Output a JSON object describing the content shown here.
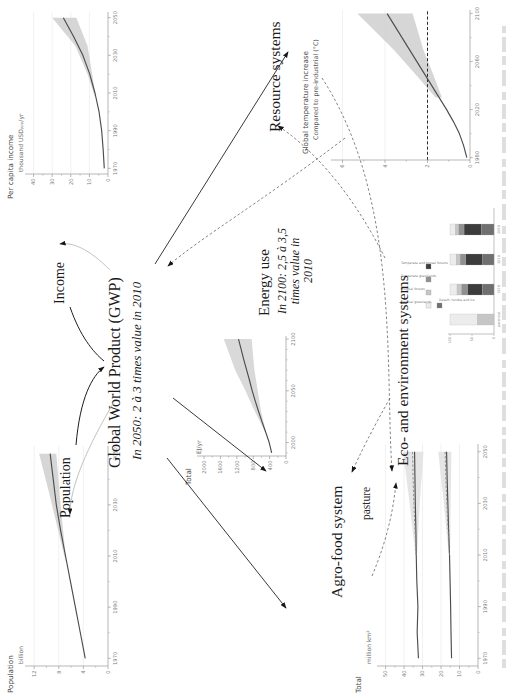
{
  "labels": {
    "population": "Population",
    "income": "Income",
    "gwp_title": "Global World Product (GWP)",
    "gwp_note": "In 2050: 2 à 3 times value in 2010",
    "energy_use": "Energy use",
    "energy_note1": "In 2100: 2,5 à 3,5",
    "energy_note2": "times value in",
    "energy_note3": "2010",
    "agro_heading": "Agro-food system",
    "resource_heading": "Resource systems",
    "eco_heading": "Eco- and environment systems"
  },
  "colors": {
    "curve": "#4d4d4d",
    "band": "#d2d2d2",
    "band_light": "#e0e0e0",
    "axis": "#9a9a9a",
    "arrow": "#161616",
    "feedback": "#bbbbbb",
    "dashed": "#6e6e6e"
  },
  "chart_data": [
    {
      "id": "population",
      "type": "line",
      "title": "Population",
      "ylabel": "billion",
      "xlim": [
        1967,
        2053
      ],
      "ylim": [
        0,
        13
      ],
      "xticks": [
        1970,
        1990,
        2010,
        2030,
        2050
      ],
      "xminor": [
        1980,
        2000,
        2020,
        2040
      ],
      "yticks": [
        0,
        4,
        8,
        12
      ],
      "yminor": [
        2,
        6,
        10
      ],
      "grid": true,
      "band_color": "#cfcfcf",
      "series": [
        {
          "name": "world population",
          "style": "solid",
          "x": [
            1970,
            1980,
            1990,
            2000,
            2010,
            2020,
            2030,
            2040,
            2050
          ],
          "y": [
            3.7,
            4.5,
            5.3,
            6.1,
            6.9,
            7.7,
            8.4,
            8.9,
            9.4
          ]
        }
      ],
      "bands": [
        {
          "x": [
            2008,
            2020,
            2035,
            2050
          ],
          "lo": [
            6.8,
            7.3,
            7.9,
            8.4
          ],
          "hi": [
            6.9,
            8.1,
            9.6,
            11.2
          ]
        }
      ]
    },
    {
      "id": "income",
      "type": "line",
      "title": "Per capita income",
      "ylabel": "thousand USD",
      "ylabel_sub": "PPP",
      "ylabel_tail": "/yr",
      "xlim": [
        1967,
        2053
      ],
      "ylim": [
        0,
        43
      ],
      "xticks": [
        1970,
        1990,
        2010,
        2030,
        2050
      ],
      "xminor": [
        1980,
        2000,
        2020,
        2040
      ],
      "yticks": [
        0,
        10,
        20,
        30,
        40
      ],
      "yminor": [
        5,
        15,
        25,
        35
      ],
      "grid": true,
      "band_color": "#cfcfcf",
      "series": [
        {
          "name": "per capita income",
          "style": "solid",
          "x": [
            1970,
            1980,
            1990,
            2000,
            2010,
            2020,
            2030,
            2040,
            2050
          ],
          "y": [
            2,
            2.6,
            3.4,
            4.8,
            7,
            9.8,
            13.5,
            18.5,
            24
          ]
        }
      ],
      "bands": [
        {
          "x": [
            2008,
            2020,
            2035,
            2050
          ],
          "lo": [
            6.6,
            8.5,
            11,
            17
          ],
          "hi": [
            7.1,
            11,
            17.5,
            30
          ]
        }
      ]
    },
    {
      "id": "energy",
      "type": "line",
      "title": "Total",
      "ylabel": "EJ/yr",
      "xlim": [
        1987,
        2103
      ],
      "ylim": [
        0,
        2100
      ],
      "xticks": [
        2000,
        2050,
        2100
      ],
      "xminor": [
        1990,
        2010,
        2020,
        2030,
        2040,
        2060,
        2070,
        2080,
        2090
      ],
      "yticks": [
        0,
        400,
        800,
        1200,
        1600,
        2000
      ],
      "yminor": [
        200,
        600,
        1000,
        1400,
        1800
      ],
      "grid": false,
      "band_color": "#d2d2d2",
      "series": [
        {
          "name": "total energy use",
          "style": "solid",
          "x": [
            1990,
            2000,
            2010,
            2020,
            2030,
            2040,
            2050,
            2060,
            2070,
            2080,
            2090,
            2100
          ],
          "y": [
            350,
            410,
            495,
            585,
            670,
            750,
            825,
            890,
            960,
            1030,
            1095,
            1160
          ]
        }
      ],
      "bands": [
        {
          "x": [
            2010,
            2030,
            2050,
            2070,
            2100
          ],
          "lo": [
            485,
            610,
            690,
            770,
            840
          ],
          "hi": [
            510,
            760,
            990,
            1240,
            1520
          ]
        }
      ]
    },
    {
      "id": "temperature",
      "type": "line",
      "title": "Global temperature increase",
      "subtitle": "Compared to pre-industrial (°C)",
      "xlim": [
        1978,
        2103
      ],
      "ylim": [
        0,
        6.4
      ],
      "xticks": [
        1980,
        2020,
        2060,
        2100
      ],
      "xminor": [
        2000,
        2040,
        2080
      ],
      "yticks": [
        0,
        2,
        4,
        6
      ],
      "yminor": [
        1,
        3,
        5
      ],
      "grid": true,
      "refline": 2,
      "band_color": "#cfcfcf",
      "series": [
        {
          "name": "temperature increase",
          "style": "solid",
          "x": [
            1980,
            1990,
            2000,
            2010,
            2020,
            2030,
            2040,
            2050,
            2060,
            2070,
            2080,
            2090,
            2100
          ],
          "y": [
            0.15,
            0.3,
            0.5,
            0.78,
            1.1,
            1.45,
            1.8,
            2.15,
            2.5,
            2.85,
            3.2,
            3.55,
            3.9
          ]
        }
      ],
      "bands": [
        {
          "x": [
            2030,
            2050,
            2070,
            2100
          ],
          "lo": [
            1.32,
            1.75,
            2.2,
            2.7
          ],
          "hi": [
            1.62,
            2.6,
            3.6,
            5.3
          ]
        }
      ]
    },
    {
      "id": "agrofood",
      "type": "line",
      "title": "Total",
      "ylabel": "million km²",
      "annotation": "pasture",
      "xlim": [
        1967,
        2053
      ],
      "ylim": [
        0,
        53
      ],
      "xticks": [
        1970,
        1990,
        2010,
        2030,
        2050
      ],
      "xminor": [
        1980,
        2000,
        2020,
        2040
      ],
      "yticks": [
        0,
        10,
        20,
        30,
        40,
        50
      ],
      "yminor": [
        5,
        15,
        25,
        35,
        45
      ],
      "grid": true,
      "band_color": "#e0e0e0",
      "series": [
        {
          "name": "pasture",
          "style": "solid",
          "x": [
            1970,
            1980,
            1990,
            2000,
            2010,
            2020,
            2030,
            2040,
            2050
          ],
          "y": [
            32.2,
            32.9,
            32.5,
            33.1,
            33.4,
            33.6,
            33.9,
            34.1,
            34.3
          ]
        },
        {
          "name": "pasture scenario",
          "style": "dashed",
          "x": [
            2010,
            2020,
            2030,
            2040,
            2050
          ],
          "y": [
            33.4,
            34.1,
            34.7,
            35.1,
            35.4
          ]
        },
        {
          "name": "cropland",
          "style": "solid",
          "x": [
            1970,
            1980,
            1990,
            2000,
            2010,
            2020,
            2030,
            2040,
            2050
          ],
          "y": [
            14.3,
            14.6,
            14.8,
            15.1,
            15.4,
            15.9,
            16.3,
            16.7,
            17
          ]
        },
        {
          "name": "cropland scenario",
          "style": "dashed",
          "x": [
            2010,
            2020,
            2030,
            2040,
            2050
          ],
          "y": [
            15.4,
            16.2,
            16.9,
            17.4,
            17.8
          ]
        }
      ],
      "bands": [
        {
          "x": [
            2010,
            2030,
            2050
          ],
          "lo": [
            33,
            31.5,
            29.5
          ],
          "hi": [
            33.8,
            37,
            40.5
          ]
        },
        {
          "x": [
            2010,
            2030,
            2050
          ],
          "lo": [
            15.1,
            14.8,
            14.4
          ],
          "hi": [
            15.8,
            18.5,
            21.5
          ]
        }
      ]
    },
    {
      "id": "eco",
      "type": "stacked-bar",
      "categories": [
        "potential",
        "1970",
        "2010",
        "2050"
      ],
      "yticks": [
        0,
        50,
        100
      ],
      "legend": [
        "Tropical grasslands",
        "Tropical forests",
        "Temperate grasslands",
        "Temperate and boreal forests"
      ],
      "legend_separate": "Desert, tundra and ice",
      "colors": [
        "#ececec",
        "#c6c6c6",
        "#909090",
        "#3c3c3c",
        "#707070"
      ],
      "bars": [
        [
          62,
          38,
          0,
          0,
          0
        ],
        [
          16,
          10,
          14,
          34,
          26
        ],
        [
          14,
          9,
          13,
          37,
          27
        ],
        [
          12,
          8,
          12,
          40,
          28
        ]
      ]
    }
  ]
}
